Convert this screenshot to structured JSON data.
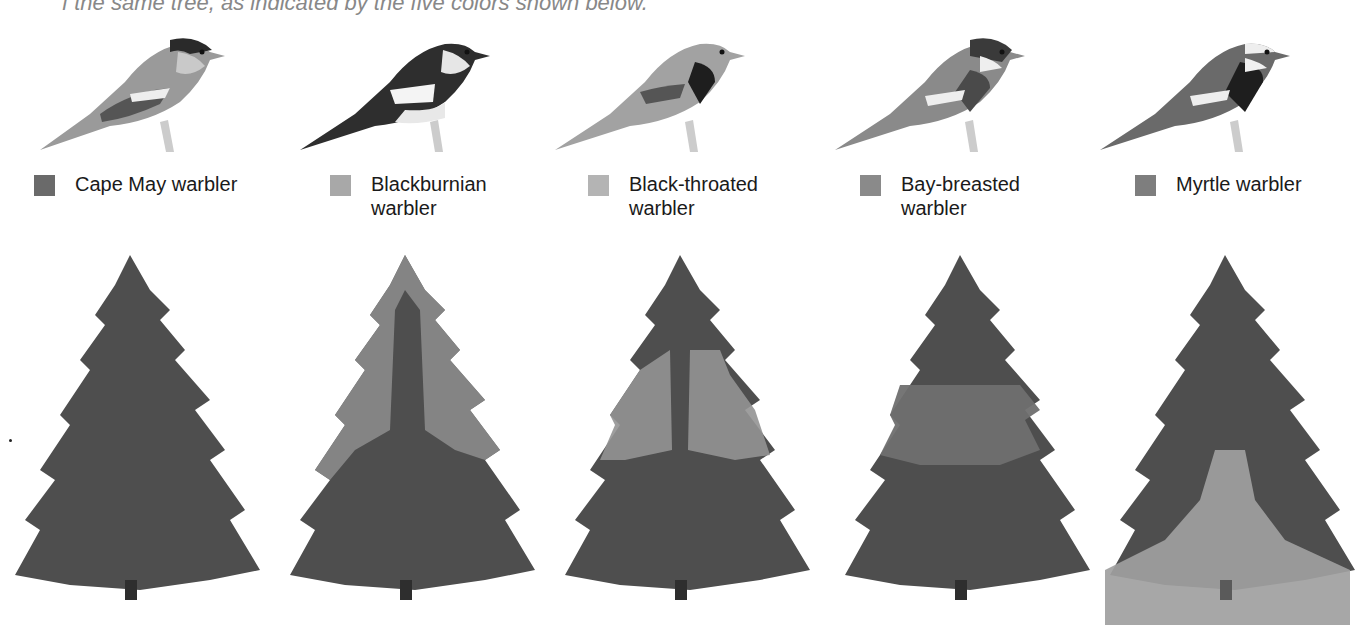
{
  "caption": "f the same tree, as indicated by the five colors shown below.",
  "figure": {
    "type": "comparative illustration",
    "species": [
      {
        "name": "Cape May warbler",
        "label_lines": [
          "Cape May warbler"
        ],
        "swatch_color": "#6a6a6a",
        "zone": "upper outer crown (entire top)",
        "bird_icon": "warbler-cape-may-icon"
      },
      {
        "name": "Blackburnian warbler",
        "label_lines": [
          "Blackburnian",
          "warbler"
        ],
        "swatch_color": "#a8a8a8",
        "zone": "upper half, outer branches",
        "bird_icon": "warbler-blackburnian-icon"
      },
      {
        "name": "Black-throated warbler",
        "label_lines": [
          "Black-throated",
          "warbler"
        ],
        "swatch_color": "#b4b4b4",
        "zone": "middle section, outer branches",
        "bird_icon": "warbler-black-throated-icon"
      },
      {
        "name": "Bay-breasted warbler",
        "label_lines": [
          "Bay-breasted",
          "warbler"
        ],
        "swatch_color": "#8a8a8a",
        "zone": "middle interior",
        "bird_icon": "warbler-bay-breasted-icon"
      },
      {
        "name": "Myrtle warbler",
        "label_lines": [
          "Myrtle warbler"
        ],
        "swatch_color": "#7e7e7e",
        "zone": "lower tree and ground",
        "bird_icon": "warbler-myrtle-icon"
      }
    ]
  },
  "colors": {
    "tree_dark": "#4a4a4a",
    "tree_mid": "#5e5e5e",
    "highlight_light": "#9a9a9a",
    "ground_band": "#a6a6a6"
  }
}
